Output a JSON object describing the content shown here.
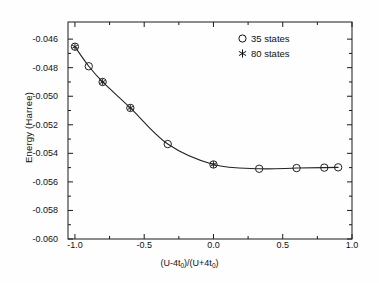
{
  "chart_data": {
    "type": "line",
    "title": "",
    "xlabel": "(U-4t0)/(U+4t0)",
    "xlabel_parts": {
      "pre": "(U-4t",
      "sub1": "0",
      "mid": ")/(U+4t",
      "sub2": "0",
      "post": ")"
    },
    "ylabel": "Energy  (Harree)",
    "xlim": [
      -1.05,
      1.0
    ],
    "ylim": [
      -0.06,
      -0.0448
    ],
    "xticks": [
      -1.0,
      -0.5,
      0.0,
      0.5,
      1.0
    ],
    "xticklabels": [
      "-1.0",
      "-0.5",
      "0.0",
      "0.5",
      "1.0"
    ],
    "xminorticks": [
      -0.75,
      -0.25,
      0.25,
      0.75
    ],
    "yticks": [
      -0.046,
      -0.048,
      -0.05,
      -0.052,
      -0.054,
      -0.056,
      -0.058,
      -0.06
    ],
    "yticklabels": [
      "-0.046",
      "-0.048",
      "-0.050",
      "-0.052",
      "-0.054",
      "-0.056",
      "-0.058",
      "-0.060"
    ],
    "yminorticks": [
      -0.047,
      -0.049,
      -0.051,
      -0.053,
      -0.055,
      -0.057,
      -0.059
    ],
    "grid": false,
    "legend_position": "upper right",
    "frame": true,
    "tick_direction": "in",
    "series": [
      {
        "name": "35 states",
        "marker": "circle",
        "line": "solid",
        "color": "#222222",
        "x": [
          -1.0,
          -0.9,
          -0.8,
          -0.6,
          -0.33,
          0.0,
          0.33,
          0.6,
          0.8,
          0.9
        ],
        "y": [
          -0.04653,
          -0.0479,
          -0.049,
          -0.05082,
          -0.05335,
          -0.05478,
          -0.05508,
          -0.05503,
          -0.055,
          -0.05498
        ]
      },
      {
        "name": "80 states",
        "marker": "asterisk",
        "line": "solid",
        "color": "#222222",
        "x": [
          -1.0,
          -0.8,
          -0.6,
          0.0
        ],
        "y": [
          -0.04653,
          -0.049,
          -0.05082,
          -0.05478
        ]
      }
    ]
  },
  "legend": {
    "items": [
      {
        "label": "35 states",
        "marker": "circle"
      },
      {
        "label": "80 states",
        "marker": "asterisk"
      }
    ]
  }
}
